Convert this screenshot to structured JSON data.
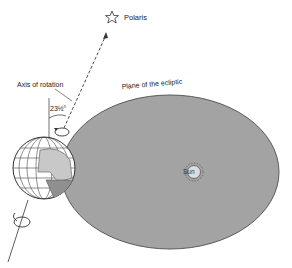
{
  "diagram": {
    "labels": {
      "polaris": "Polaris",
      "axis_of_rotation": "Axis of rotation",
      "plane_of_ecliptic": "Plane of the ecliptic",
      "tilt_angle": "23½°",
      "sun": "Sun"
    },
    "elements": {
      "ecliptic_plane": {
        "shape": "ellipse",
        "fill": "#a3a3a3",
        "stroke": "#555555"
      },
      "earth": {
        "shape": "globe",
        "fill": "#ffffff",
        "grid": "#444444"
      },
      "sun": {
        "shape": "circle-with-rays",
        "fill": "#d8d8d8"
      },
      "axis": {
        "style": "solid below, dashed above",
        "color": "#333333"
      },
      "polaris_marker": {
        "shape": "star-outline"
      }
    },
    "colors": {
      "background": "#ffffff",
      "plane": "#a3a3a3",
      "line": "#333333"
    }
  }
}
